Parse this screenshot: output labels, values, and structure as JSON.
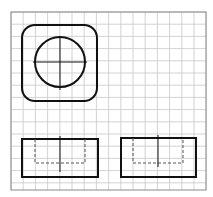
{
  "diagram": {
    "type": "orthographic-projection-on-grid",
    "colors": {
      "background": "#ffffff",
      "grid": "#c8c8c8",
      "grid_border": "#8a8a8a",
      "stroke": "#111111",
      "hidden_line": "#555555"
    },
    "grid": {
      "x0": 11,
      "y0": 12,
      "x1": 206,
      "y1": 190,
      "cell": 12.2
    },
    "views": [
      {
        "name": "top-view",
        "outer_rounded_square": {
          "x": 22,
          "y": 25,
          "w": 75,
          "h": 76,
          "r": 13
        },
        "circle": {
          "cx": 60,
          "cy": 62,
          "r": 25
        },
        "center_lines": {
          "h": [
            33,
            62,
            87,
            62
          ],
          "v": [
            60,
            36,
            60,
            90
          ]
        }
      },
      {
        "name": "front-view",
        "outer_rect": {
          "x": 22,
          "y": 139,
          "w": 76,
          "h": 38
        },
        "hidden_rect": {
          "x": 35,
          "y": 139,
          "w": 50,
          "h": 24
        },
        "center_line": [
          60,
          136,
          60,
          172
        ]
      },
      {
        "name": "side-view",
        "outer_rect": {
          "x": 121,
          "y": 138,
          "w": 75,
          "h": 39
        },
        "hidden_rect": {
          "x": 133,
          "y": 138,
          "w": 50,
          "h": 25
        },
        "center_line": [
          158,
          135,
          158,
          167
        ]
      }
    ]
  }
}
